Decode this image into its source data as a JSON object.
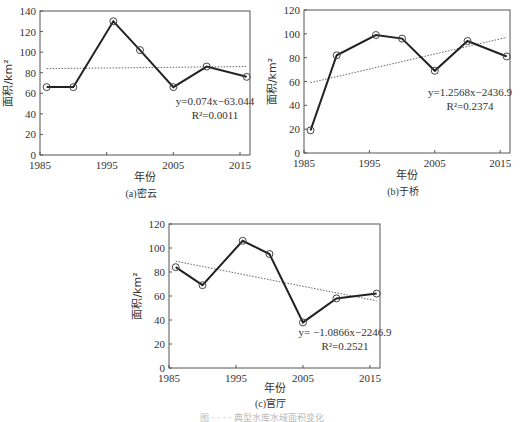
{
  "chart_data": [
    {
      "type": "line",
      "id": "a",
      "title": "",
      "caption": "(a)密云",
      "xlabel": "年份",
      "ylabel": "面积/km²",
      "x": [
        1986,
        1990,
        1996,
        2000,
        2005,
        2010,
        2016
      ],
      "series": [
        {
          "name": "面积",
          "values": [
            66,
            66,
            130,
            102,
            66,
            86,
            76
          ]
        }
      ],
      "trendline": {
        "slope": 0.074,
        "intercept": -63.044,
        "equation": "y=0.074x−63.044",
        "r2": "R²=0.0011"
      },
      "xlim": [
        1985,
        2017
      ],
      "ylim": [
        0,
        140
      ],
      "xticks": [
        1985,
        1995,
        2005,
        2015
      ],
      "yticks": [
        0,
        20,
        40,
        60,
        80,
        100,
        120,
        140
      ],
      "grid": false,
      "legend": "none"
    },
    {
      "type": "line",
      "id": "b",
      "title": "",
      "caption": "(b)于桥",
      "xlabel": "年份",
      "ylabel": "面积/km²",
      "x": [
        1986,
        1990,
        1996,
        2000,
        2005,
        2010,
        2016
      ],
      "series": [
        {
          "name": "面积",
          "values": [
            19,
            82,
            99,
            96,
            69,
            94,
            81
          ]
        }
      ],
      "trendline": {
        "slope": 1.2568,
        "intercept": -2436.9,
        "equation": "y=1.2568x−2436.9",
        "r2": "R²=0.2374"
      },
      "xlim": [
        1985,
        2017
      ],
      "ylim": [
        0,
        120
      ],
      "xticks": [
        1985,
        1995,
        2005,
        2015
      ],
      "yticks": [
        0,
        20,
        40,
        60,
        80,
        100,
        120
      ],
      "grid": false,
      "legend": "none"
    },
    {
      "type": "line",
      "id": "c",
      "title": "",
      "caption": "(c)官厅",
      "xlabel": "年份",
      "ylabel": "面积/km²",
      "x": [
        1986,
        1990,
        1996,
        2000,
        2005,
        2010,
        2016
      ],
      "series": [
        {
          "name": "面积",
          "values": [
            84,
            69,
            106,
            95,
            38,
            58,
            62
          ]
        }
      ],
      "trendline": {
        "slope": -1.0866,
        "intercept": -2246.9,
        "equation": "y= −1.0866x−2246.9",
        "r2": "R²=0.2521"
      },
      "xlim": [
        1985,
        2017
      ],
      "ylim": [
        0,
        120
      ],
      "xticks": [
        1985,
        1995,
        2005,
        2015
      ],
      "yticks": [
        0,
        20,
        40,
        60,
        80,
        100,
        120
      ],
      "grid": false,
      "legend": "none"
    }
  ],
  "layout": [
    {
      "left": 40,
      "right": 250,
      "top": 11,
      "bottom": 155,
      "trend_y_start": 84,
      "trend_y_end": 86,
      "eq_x": 215,
      "eq_y": 105,
      "r2_x": 215,
      "r2_y": 119,
      "caption_y": 197,
      "xlabel_y": 181
    },
    {
      "left": 304,
      "right": 510,
      "top": 10,
      "bottom": 153,
      "trend_y_start": 59,
      "trend_y_end": 97,
      "eq_x": 470,
      "eq_y": 96,
      "r2_x": 470,
      "r2_y": 110,
      "caption_y": 195,
      "xlabel_y": 179
    },
    {
      "left": 169,
      "right": 380,
      "top": 224,
      "bottom": 368,
      "trend_y_start": 89,
      "trend_y_end": 56,
      "eq_x": 345,
      "eq_y": 336,
      "r2_x": 345,
      "r2_y": 350,
      "caption_y": 407,
      "xlabel_y": 392
    }
  ],
  "figure_caption": "图 · · · · 典型水库水域面积变化"
}
